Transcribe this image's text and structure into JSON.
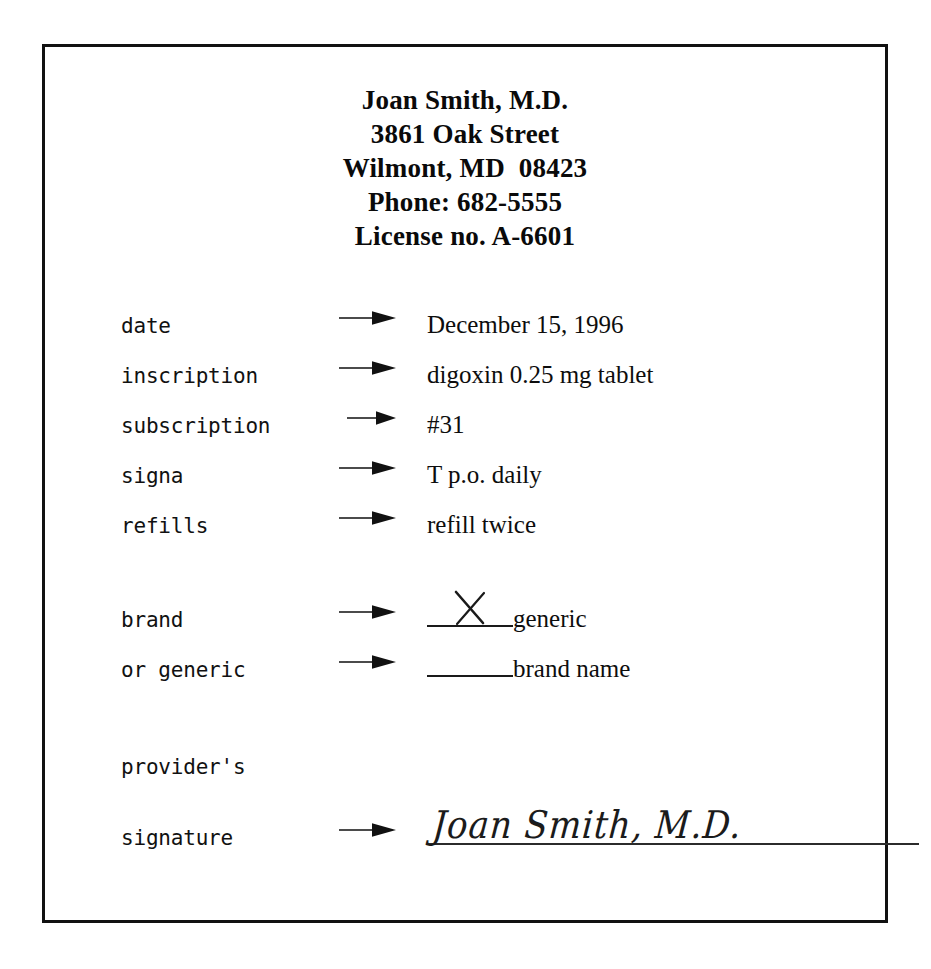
{
  "document": {
    "type": "prescription-form",
    "border_color": "#111111",
    "background_color": "#ffffff",
    "text_color": "#0d0d0d"
  },
  "letterhead": {
    "lines": [
      "Joan Smith, M.D.",
      "3861 Oak Street",
      "Wilmont, MD  08423",
      "Phone: 682-5555",
      "License no. A-6601"
    ],
    "prescriber_name": "Joan Smith, M.D.",
    "street": "3861 Oak Street",
    "city_state_zip": "Wilmont, MD  08423",
    "phone": "Phone: 682-5555",
    "license": "License no. A-6601"
  },
  "fields": [
    {
      "label": "date",
      "value": "December 15, 1996"
    },
    {
      "label": "inscription",
      "value": "digoxin 0.25 mg tablet"
    },
    {
      "label": "subscription",
      "value": "#31"
    },
    {
      "label": "signa",
      "value": "T p.o. daily"
    },
    {
      "label": "refills",
      "value": "refill twice"
    }
  ],
  "substitution": {
    "rows": [
      {
        "label": "brand",
        "blank_mark": "X",
        "checked": true,
        "option": "generic"
      },
      {
        "label": "or generic",
        "blank_mark": "",
        "checked": false,
        "option": "brand name"
      }
    ]
  },
  "signature": {
    "label_line_1": "provider's",
    "label_line_2": "signature",
    "signed_name": "Joan Smith, M.D."
  },
  "icons": {
    "arrow": "right-arrow-icon",
    "x_mark": "x-mark-icon"
  }
}
